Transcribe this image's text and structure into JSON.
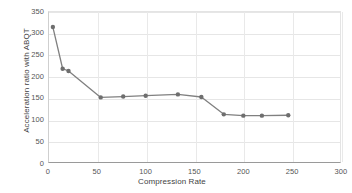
{
  "chart_data": {
    "type": "line",
    "title": "",
    "xlabel": "Compression Rate",
    "ylabel": "Acceleration ratio with ABQT",
    "xlim": [
      0,
      300
    ],
    "ylim": [
      0,
      350
    ],
    "xticks": [
      0,
      50,
      100,
      150,
      200,
      250,
      300
    ],
    "yticks": [
      0,
      50,
      100,
      150,
      200,
      250,
      300,
      350
    ],
    "xtick_labels": [
      "0",
      "50",
      "100",
      "150",
      "200",
      "250",
      "300"
    ],
    "ytick_labels": [
      "0",
      "50",
      "100",
      "150",
      "200",
      "250",
      "300",
      "350"
    ],
    "grid": true,
    "legend": "none",
    "marker": "circle",
    "series": [
      {
        "name": "Acceleration ratio with ABQT",
        "color": "#808080",
        "marker_color": "#6e6e6e",
        "x": [
          5,
          15,
          21,
          54,
          77,
          100,
          133,
          157,
          180,
          200,
          219,
          246
        ],
        "y": [
          313,
          217,
          212,
          151,
          153,
          155,
          158,
          152,
          112,
          109,
          109,
          110
        ]
      }
    ]
  },
  "axis": {
    "x_title": "Compression Rate",
    "y_title": "Acceleration ratio with ABQT"
  },
  "colors": {
    "line": "#808080",
    "marker": "#6e6e6e",
    "grid": "#e6e6e6",
    "axis": "#9a9a9a",
    "tick_text": "#555555",
    "title_text": "#3f3f3f",
    "background": "#ffffff"
  }
}
